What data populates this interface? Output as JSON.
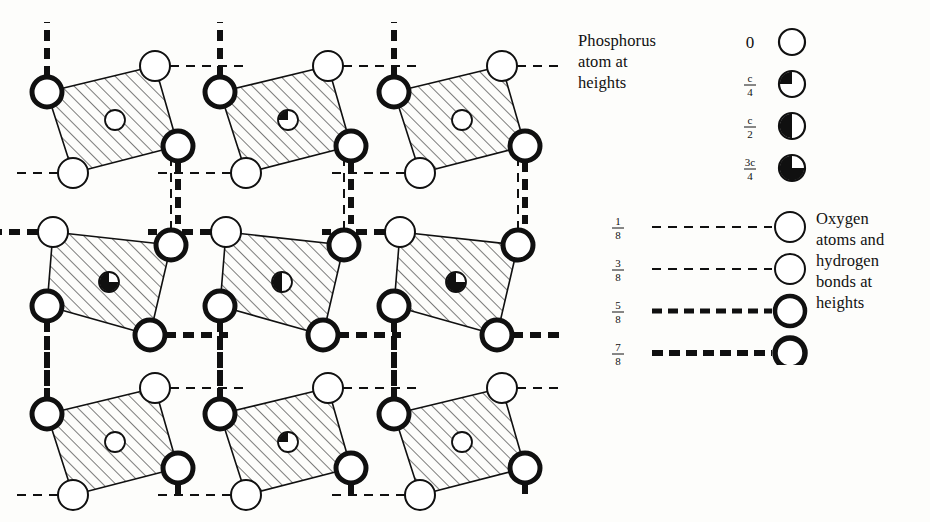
{
  "figure": {
    "type": "crystal-structure-diagram",
    "background": "#fdfdfb",
    "ink": "#101010"
  },
  "legend": {
    "phosphorus": {
      "caption_lines": [
        "Phosphorus",
        "atom at",
        "heights"
      ],
      "entries": [
        {
          "label": "0",
          "fraction": null,
          "fill": "empty",
          "fill_fraction": 0.0,
          "symbol": "open-circle"
        },
        {
          "label": null,
          "fraction": {
            "num": "c",
            "den": "4"
          },
          "fill": "quarter",
          "fill_fraction": 0.25,
          "symbol": "quarter-filled-circle"
        },
        {
          "label": null,
          "fraction": {
            "num": "c",
            "den": "2"
          },
          "fill": "half",
          "fill_fraction": 0.5,
          "symbol": "half-filled-circle"
        },
        {
          "label": null,
          "fraction": {
            "num": "3c",
            "den": "4"
          },
          "fill": "three-quarter",
          "fill_fraction": 0.75,
          "symbol": "three-quarter-filled-circle"
        }
      ]
    },
    "oxygen": {
      "caption_lines": [
        "Oxygen",
        "atoms and",
        "hydrogen",
        "bonds at",
        "heights"
      ],
      "entries": [
        {
          "fraction": {
            "num": "1",
            "den": "8"
          },
          "ring": "thin",
          "bond": "thin-dashed",
          "ring_width": 2.0,
          "dash": "9,7",
          "dash_width": 2.0
        },
        {
          "fraction": {
            "num": "3",
            "den": "8"
          },
          "ring": "thin",
          "bond": "thin-dashed",
          "ring_width": 2.0,
          "dash": "9,7",
          "dash_width": 2.0
        },
        {
          "fraction": {
            "num": "5",
            "den": "8"
          },
          "ring": "thick",
          "bond": "thick-dashed",
          "ring_width": 4.5,
          "dash": "10,6",
          "dash_width": 5.0
        },
        {
          "fraction": {
            "num": "7",
            "den": "8"
          },
          "ring": "thick",
          "bond": "thick-dashed",
          "ring_width": 5.5,
          "dash": "11,6",
          "dash_width": 6.0
        }
      ]
    }
  },
  "structure": {
    "description": "Nine PO4 tetrahedra in a 3x3 array, each drawn as a hatched quadrilateral with four oxygen corner circles and a central phosphorus circle.",
    "hatch_angle_deg": 45,
    "tetrahedra": [
      {
        "id": "top-left",
        "row": 0,
        "col": 0,
        "p_height": "0",
        "p_fill": 0.0,
        "cx": 115,
        "cy": 118
      },
      {
        "id": "top-center",
        "row": 0,
        "col": 1,
        "p_height": "c/4",
        "p_fill": 0.25,
        "cx": 290,
        "cy": 118
      },
      {
        "id": "top-right",
        "row": 0,
        "col": 2,
        "p_height": "0",
        "p_fill": 0.0,
        "cx": 465,
        "cy": 118
      },
      {
        "id": "middle-left",
        "row": 1,
        "col": 0,
        "p_height": "3c/4",
        "p_fill": 0.75,
        "cx": 123,
        "cy": 282
      },
      {
        "id": "middle-center",
        "row": 1,
        "col": 1,
        "p_height": "c/2",
        "p_fill": 0.5,
        "cx": 288,
        "cy": 282
      },
      {
        "id": "middle-right",
        "row": 1,
        "col": 2,
        "p_height": "3c/4",
        "p_fill": 0.75,
        "cx": 448,
        "cy": 282
      },
      {
        "id": "bottom-left",
        "row": 2,
        "col": 0,
        "p_height": "0",
        "p_fill": 0.0,
        "cx": 115,
        "cy": 440
      },
      {
        "id": "bottom-center",
        "row": 2,
        "col": 1,
        "p_height": "c/4",
        "p_fill": 0.25,
        "cx": 290,
        "cy": 440
      },
      {
        "id": "bottom-right",
        "row": 2,
        "col": 2,
        "p_height": "0",
        "p_fill": 0.0,
        "cx": 465,
        "cy": 440
      }
    ],
    "oxygen_radius": 15,
    "phosphorus_radius": 10
  }
}
